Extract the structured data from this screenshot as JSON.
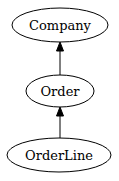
{
  "diagram": {
    "type": "directed-graph",
    "nodes": [
      {
        "id": "company",
        "label": "Company"
      },
      {
        "id": "order",
        "label": "Order"
      },
      {
        "id": "orderline",
        "label": "OrderLine"
      }
    ],
    "edges": [
      {
        "from": "orderline",
        "to": "order"
      },
      {
        "from": "order",
        "to": "company"
      }
    ],
    "colors": {
      "stroke": "#000000",
      "fill": "#ffffff",
      "text": "#000000"
    }
  }
}
